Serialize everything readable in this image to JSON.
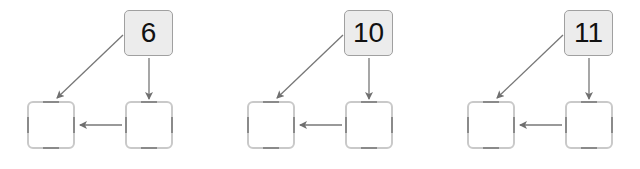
{
  "diagram": {
    "colors": {
      "arrow": "#777777",
      "top_box_fill": "#ececec",
      "top_box_border": "#a0a0a0",
      "empty_box_border": "#c9c9c9",
      "empty_box_accent": "#8a8a8a",
      "text": "#111111"
    },
    "panels": [
      {
        "top_value": "6"
      },
      {
        "top_value": "10"
      },
      {
        "top_value": "11"
      }
    ]
  }
}
